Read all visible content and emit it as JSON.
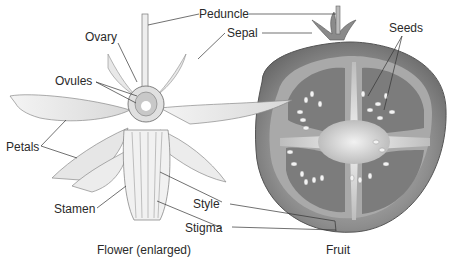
{
  "diagram": {
    "labels": {
      "peduncle": "Peduncle",
      "sepal": "Sepal",
      "ovary": "Ovary",
      "ovules": "Ovules",
      "seeds": "Seeds",
      "petals": "Petals",
      "stamen": "Stamen",
      "style": "Style",
      "stigma": "Stigma"
    },
    "captions": {
      "flower": "Flower (enlarged)",
      "fruit": "Fruit"
    }
  }
}
